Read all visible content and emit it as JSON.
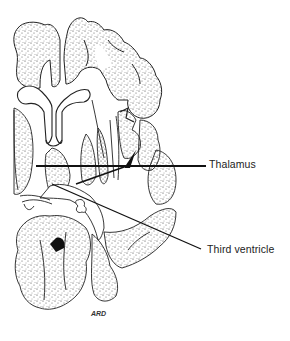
{
  "figure": {
    "labels": [
      {
        "id": "thalamus",
        "text": "Thalamus"
      },
      {
        "id": "third-ventricle",
        "text": "Third ventricle"
      }
    ],
    "artist_signature": "ARD"
  }
}
